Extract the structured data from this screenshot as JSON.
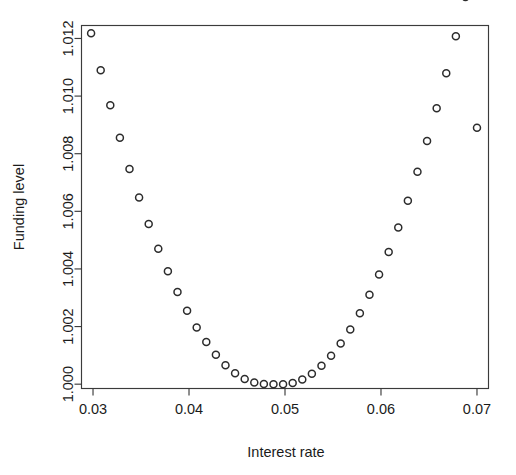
{
  "chart_data": {
    "type": "scatter",
    "title": "",
    "xlabel": "Interest rate",
    "ylabel": "Funding level",
    "xlim": [
      0.0288,
      0.0712
    ],
    "ylim": [
      0.99985,
      1.01245
    ],
    "grid": false,
    "legend": null,
    "marker": "open-circle",
    "marker_color": "#2c2c2c",
    "xticks": [
      0.03,
      0.04,
      0.05,
      0.06,
      0.07
    ],
    "xticklabels": [
      "0.03",
      "0.04",
      "0.05",
      "0.06",
      "0.07"
    ],
    "yticks": [
      1.0,
      1.002,
      1.004,
      1.006,
      1.008,
      1.01,
      1.012
    ],
    "yticklabels": [
      "1.000",
      "1.002",
      "1.004",
      "1.006",
      "1.008",
      "1.010",
      "1.012"
    ],
    "x": [
      0.0298,
      0.0308,
      0.0318,
      0.0328,
      0.0338,
      0.0348,
      0.0358,
      0.0368,
      0.0378,
      0.0388,
      0.0398,
      0.0408,
      0.0418,
      0.0428,
      0.0438,
      0.0448,
      0.0458,
      0.0468,
      0.0478,
      0.0488,
      0.0498,
      0.0508,
      0.0518,
      0.0528,
      0.0538,
      0.0548,
      0.0558,
      0.0568,
      0.0578,
      0.0588,
      0.0598,
      0.0608,
      0.0618,
      0.0628,
      0.0638,
      0.0648,
      0.0658,
      0.0668,
      0.0678,
      0.0688,
      0.07
    ],
    "y": [
      1.01218,
      1.0109,
      1.00968,
      1.00855,
      1.00747,
      1.00648,
      1.00556,
      1.0047,
      1.00392,
      1.0032,
      1.00255,
      1.00197,
      1.00146,
      1.00102,
      1.00066,
      1.00038,
      1.00018,
      1.00006,
      1.00001,
      1.0,
      1.0,
      1.00004,
      1.00016,
      1.00036,
      1.00064,
      1.00099,
      1.00141,
      1.0019,
      1.00246,
      1.0031,
      1.00381,
      1.00459,
      1.00544,
      1.00637,
      1.00737,
      1.00844,
      1.00958,
      1.01079,
      1.01208,
      1.01344,
      1.0089
    ]
  },
  "axes": {
    "y_axis_title": "Funding level",
    "x_axis_title": "Interest rate"
  }
}
